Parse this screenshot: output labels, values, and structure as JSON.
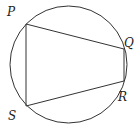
{
  "diagram": {
    "type": "inscribed-quadrilateral",
    "circle": {
      "cx": 68.5,
      "cy": 64.5,
      "r": 58.5
    },
    "stroke_color": "#333333",
    "vertices": [
      {
        "name": "P",
        "x": 26,
        "y": 24,
        "label_x": 7,
        "label_y": 16
      },
      {
        "name": "Q",
        "x": 124,
        "y": 49,
        "label_x": 124,
        "label_y": 47
      },
      {
        "name": "R",
        "x": 124,
        "y": 81,
        "label_x": 118,
        "label_y": 101
      },
      {
        "name": "S",
        "x": 26,
        "y": 106,
        "label_x": 8,
        "label_y": 120
      }
    ],
    "edges": [
      [
        "P",
        "Q"
      ],
      [
        "Q",
        "R"
      ],
      [
        "R",
        "S"
      ],
      [
        "S",
        "P"
      ]
    ]
  }
}
